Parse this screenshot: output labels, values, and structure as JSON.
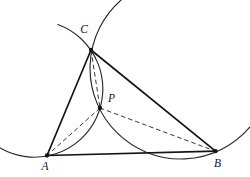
{
  "figure": {
    "colors": {
      "background": "#ffffff",
      "edge_ink": "#141414",
      "arc_ink": "#2a2a2a",
      "dash_ink": "#2a2a2a",
      "dot_ink": "#111111",
      "label_ink": "#141414"
    },
    "points": {
      "A": {
        "x": 47,
        "y": 155.5
      },
      "B": {
        "x": 215.5,
        "y": 151.2
      },
      "C": {
        "x": 91,
        "y": 50
      },
      "P": {
        "x": 100,
        "y": 108
      }
    },
    "labels": {
      "A": {
        "text": "A",
        "x": 45,
        "y": 170
      },
      "B": {
        "text": "B",
        "x": 217.5,
        "y": 166.5
      },
      "C": {
        "text": "C",
        "x": 84,
        "y": 32.5
      },
      "P": {
        "text": "P",
        "x": 111.5,
        "y": 102
      }
    },
    "edges": [
      {
        "from": "A",
        "to": "C"
      },
      {
        "from": "C",
        "to": "B"
      },
      {
        "from": "A",
        "to": "B"
      }
    ],
    "dashed": [
      {
        "from": "C",
        "to": "P"
      },
      {
        "from": "P",
        "to": "A"
      },
      {
        "from": "P",
        "to": "B"
      }
    ],
    "arcs": [
      {
        "name": "circle-CPA",
        "r": 68.4,
        "from": [
          57.8,
          24.5
        ],
        "to": [
          0.2,
          148.0
        ],
        "large": 1,
        "sweep": 1
      },
      {
        "name": "circle-CPB",
        "r": 90.7,
        "from": [
          121.1,
          0.0
        ],
        "to": [
          250.0,
          126.9
        ],
        "large": 1,
        "sweep": 0
      }
    ],
    "dot_radius": 2.15
  }
}
